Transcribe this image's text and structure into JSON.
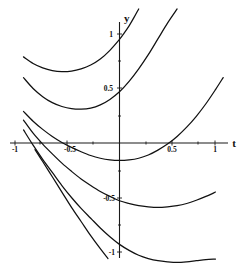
{
  "chart_data": {
    "type": "line",
    "title": "",
    "xlabel": "t",
    "ylabel": "y",
    "xlim": [
      -1.08,
      1.12
    ],
    "ylim": [
      -1.12,
      1.12
    ],
    "grid": false,
    "legend": null,
    "x_ticks": [
      {
        "value": -1,
        "label": "-1"
      },
      {
        "value": -0.5,
        "label": "-0.5"
      },
      {
        "value": 0.5,
        "label": "0.5"
      },
      {
        "value": 1,
        "label": "1"
      }
    ],
    "y_ticks": [
      {
        "value": 1,
        "label": "1"
      },
      {
        "value": 0.5,
        "label": "0.5"
      },
      {
        "value": -0.5,
        "label": "-0.5"
      },
      {
        "value": -1,
        "label": "-1"
      }
    ],
    "series": [
      {
        "name": "curve-1",
        "x": [
          -1.0,
          -0.9,
          -0.8,
          -0.7,
          -0.6,
          -0.5,
          -0.4,
          -0.3,
          -0.2,
          -0.1,
          0.0,
          0.05,
          0.1,
          0.15,
          0.2
        ],
        "y": [
          0.79,
          0.73,
          0.69,
          0.665,
          0.655,
          0.66,
          0.68,
          0.715,
          0.77,
          0.85,
          0.95,
          1.01,
          1.075,
          1.15,
          1.23
        ]
      },
      {
        "name": "curve-2",
        "x": [
          -1.0,
          -0.9,
          -0.8,
          -0.7,
          -0.6,
          -0.5,
          -0.4,
          -0.3,
          -0.2,
          -0.1,
          0.0,
          0.1,
          0.2,
          0.3,
          0.4,
          0.5,
          0.6
        ],
        "y": [
          0.6,
          0.5,
          0.425,
          0.37,
          0.335,
          0.315,
          0.31,
          0.32,
          0.35,
          0.4,
          0.47,
          0.565,
          0.68,
          0.81,
          0.955,
          1.1,
          1.23
        ]
      },
      {
        "name": "curve-3",
        "x": [
          -1.0,
          -0.9,
          -0.8,
          -0.7,
          -0.6,
          -0.5,
          -0.4,
          -0.3,
          -0.2,
          -0.1,
          0.0,
          0.1,
          0.2,
          0.3,
          0.4,
          0.5,
          0.6,
          0.7,
          0.8,
          0.9,
          1.0,
          1.08
        ],
        "y": [
          0.29,
          0.2,
          0.125,
          0.06,
          0.005,
          -0.04,
          -0.08,
          -0.115,
          -0.14,
          -0.155,
          -0.16,
          -0.155,
          -0.14,
          -0.11,
          -0.065,
          -0.01,
          0.06,
          0.145,
          0.245,
          0.36,
          0.49,
          0.6
        ]
      },
      {
        "name": "curve-4",
        "x": [
          -1.0,
          -0.9,
          -0.8,
          -0.7,
          -0.6,
          -0.5,
          -0.4,
          -0.3,
          -0.2,
          -0.1,
          0.0,
          0.1,
          0.2,
          0.3,
          0.4,
          0.5,
          0.6,
          0.7,
          0.8,
          0.9,
          1.0
        ],
        "y": [
          0.21,
          0.09,
          -0.01,
          -0.1,
          -0.185,
          -0.26,
          -0.33,
          -0.39,
          -0.445,
          -0.49,
          -0.53,
          -0.555,
          -0.575,
          -0.585,
          -0.59,
          -0.585,
          -0.575,
          -0.555,
          -0.525,
          -0.49,
          -0.45
        ]
      },
      {
        "name": "curve-5",
        "x": [
          -1.0,
          -0.9,
          -0.8,
          -0.7,
          -0.6,
          -0.5,
          -0.4,
          -0.3,
          -0.2,
          -0.1,
          0.0,
          0.1,
          0.2,
          0.3,
          0.4,
          0.5,
          0.6,
          0.7,
          0.8,
          0.9,
          1.0
        ],
        "y": [
          0.12,
          -0.02,
          -0.15,
          -0.27,
          -0.39,
          -0.5,
          -0.6,
          -0.69,
          -0.78,
          -0.86,
          -0.93,
          -0.985,
          -1.03,
          -1.06,
          -1.08,
          -1.09,
          -1.095,
          -1.09,
          -1.08,
          -1.07,
          -1.065
        ]
      },
      {
        "name": "curve-6",
        "x": [
          -0.88,
          -0.8,
          -0.7,
          -0.6,
          -0.5,
          -0.4,
          -0.3,
          -0.2,
          -0.12
        ],
        "y": [
          -0.06,
          -0.17,
          -0.31,
          -0.45,
          -0.59,
          -0.72,
          -0.85,
          -0.97,
          -1.06
        ]
      }
    ]
  },
  "axes": {
    "x_axis_name": "t",
    "y_axis_name": "y"
  }
}
